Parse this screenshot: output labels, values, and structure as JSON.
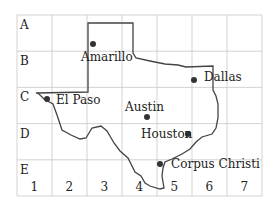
{
  "grid": {
    "rows": [
      "A",
      "B",
      "C",
      "D",
      "E"
    ],
    "cols": [
      "1",
      "2",
      "3",
      "4",
      "5",
      "6",
      "7"
    ]
  },
  "cities": [
    {
      "name": "Amarillo",
      "dot": [
        93,
        44
      ],
      "label": [
        81,
        51
      ]
    },
    {
      "name": "Dallas",
      "dot": [
        194,
        80
      ],
      "label": [
        204,
        71
      ]
    },
    {
      "name": "El Paso",
      "dot": [
        47,
        99
      ],
      "label": [
        56,
        94
      ]
    },
    {
      "name": "Austin",
      "dot": [
        147,
        117
      ],
      "label": [
        125,
        101
      ]
    },
    {
      "name": "Houston",
      "dot": [
        188,
        134
      ],
      "label": [
        141,
        128
      ]
    },
    {
      "name": "Corpus Christi",
      "dot": [
        160,
        164
      ],
      "label": [
        171,
        158
      ]
    }
  ],
  "colors": {
    "grid": "#c8c8c8",
    "border": "#444444",
    "dot": "#333333"
  }
}
